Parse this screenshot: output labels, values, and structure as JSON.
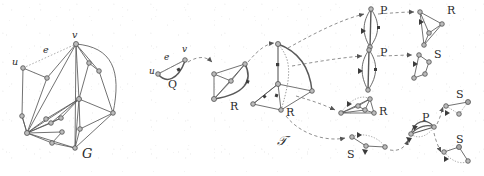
{
  "figure": {
    "background": "#ffffff",
    "stroke_color": "#4a4a4a",
    "node_fill": "#b9b9b9",
    "node_stroke": "#545454",
    "dashed_color": "#6e6e6e",
    "dotted_color": "#8a8a8a",
    "label_color": "#2b2b2b"
  },
  "labels": {
    "graph_G": "G",
    "tree_T": "𝒯",
    "vertex_u_left": "u",
    "vertex_v_left": "v",
    "edge_e_left": "e",
    "vertex_u_q": "u",
    "vertex_v_q": "v",
    "edge_e_q": "e",
    "node_Q": "Q",
    "node_R1": "R",
    "node_R2": "R",
    "node_P1": "P",
    "node_P2": "P",
    "node_R3": "R",
    "node_R4": "R",
    "node_S1": "S",
    "node_S2": "S",
    "node_S3": "S",
    "node_S4": "S",
    "node_P3": "P"
  },
  "graph_G": {
    "name": "G",
    "vertex_count": 16,
    "marked_vertices": [
      "u",
      "v"
    ],
    "marked_edge": "e",
    "vertices": [
      {
        "id": "v",
        "x": 76,
        "y": 44
      },
      {
        "id": "u",
        "x": 23,
        "y": 68
      },
      {
        "id": "a",
        "x": 47,
        "y": 78
      },
      {
        "id": "b",
        "x": 99,
        "y": 71
      },
      {
        "id": "c",
        "x": 89,
        "y": 63
      },
      {
        "id": "d",
        "x": 79,
        "y": 99
      },
      {
        "id": "f",
        "x": 27,
        "y": 133
      },
      {
        "id": "g",
        "x": 51,
        "y": 123
      },
      {
        "id": "h",
        "x": 61,
        "y": 118
      },
      {
        "id": "i",
        "x": 46,
        "y": 119
      },
      {
        "id": "j",
        "x": 62,
        "y": 132
      },
      {
        "id": "k",
        "x": 52,
        "y": 143
      },
      {
        "id": "l",
        "x": 75,
        "y": 148
      },
      {
        "id": "m",
        "x": 80,
        "y": 129
      },
      {
        "id": "n",
        "x": 113,
        "y": 113
      },
      {
        "id": "o",
        "x": 22,
        "y": 116
      }
    ]
  },
  "tree_T": {
    "name": "𝒯",
    "node_types": [
      "Q",
      "R",
      "P",
      "S"
    ],
    "nodes": [
      {
        "label": "Q",
        "x": 175,
        "y": 76,
        "kind": "Q"
      },
      {
        "label": "R",
        "x": 234,
        "y": 104,
        "kind": "R"
      },
      {
        "label": "R",
        "x": 290,
        "y": 110,
        "kind": "R"
      },
      {
        "label": "P",
        "x": 383,
        "y": 15,
        "kind": "P"
      },
      {
        "label": "P",
        "x": 383,
        "y": 57,
        "kind": "P"
      },
      {
        "label": "R",
        "x": 441,
        "y": 14,
        "kind": "R"
      },
      {
        "label": "S",
        "x": 441,
        "y": 57,
        "kind": "S"
      },
      {
        "label": "R",
        "x": 380,
        "y": 108,
        "kind": "R"
      },
      {
        "label": "S",
        "x": 350,
        "y": 152,
        "kind": "S"
      },
      {
        "label": "P",
        "x": 427,
        "y": 125,
        "kind": "P"
      },
      {
        "label": "S",
        "x": 461,
        "y": 100,
        "kind": "S"
      },
      {
        "label": "S",
        "x": 461,
        "y": 145,
        "kind": "S"
      }
    ],
    "edges": [
      {
        "from": "Q",
        "to": "R1",
        "style": "dashed"
      },
      {
        "from": "R1",
        "to": "R2",
        "style": "dashed"
      },
      {
        "from": "R2",
        "to": "P1",
        "style": "dashed"
      },
      {
        "from": "R2",
        "to": "P2",
        "style": "dashed"
      },
      {
        "from": "R2",
        "to": "R3",
        "style": "dashed"
      },
      {
        "from": "R2",
        "to": "S1",
        "style": "dashed"
      },
      {
        "from": "P1",
        "to": "R4",
        "style": "dashed"
      },
      {
        "from": "P2",
        "to": "S2",
        "style": "dashed"
      },
      {
        "from": "S1",
        "to": "P3",
        "style": "dashed"
      },
      {
        "from": "P3",
        "to": "S3",
        "style": "dashed"
      },
      {
        "from": "P3",
        "to": "S4",
        "style": "dashed"
      }
    ]
  }
}
